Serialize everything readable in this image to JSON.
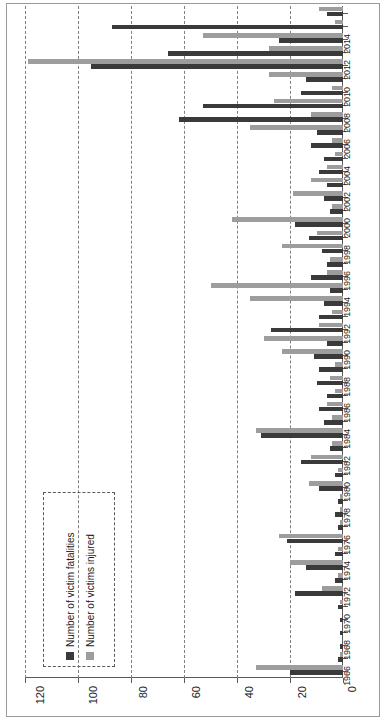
{
  "chart_data": {
    "type": "bar",
    "orientation": "horizontal",
    "title": "",
    "xlabel": "",
    "ylabel": "",
    "xlim": [
      0,
      120
    ],
    "x_axis_reversed": true,
    "xticks": [
      120,
      100,
      80,
      60,
      40,
      20,
      0
    ],
    "grid": true,
    "legend_position": "inside-left",
    "categories": [
      "2016",
      "2015",
      "2014",
      "2013",
      "2012",
      "2011",
      "2010",
      "2009",
      "2008",
      "2007",
      "2006",
      "2005",
      "2004",
      "2003",
      "2002",
      "2001",
      "2000",
      "1999",
      "1998",
      "1997",
      "1996",
      "1995",
      "1994",
      "1993",
      "1992",
      "1991",
      "1990",
      "1989",
      "1988",
      "1987",
      "1986",
      "1985",
      "1984",
      "1983",
      "1982",
      "1981",
      "1980",
      "1979",
      "1978",
      "1977",
      "1976",
      "1975",
      "1974",
      "1973",
      "1972",
      "1971",
      "1970",
      "1969",
      "1968",
      "1967",
      "1966"
    ],
    "series": [
      {
        "name": "Number of victim fatalities",
        "color": "#3a3a3a",
        "values": [
          6,
          87,
          24,
          66,
          95,
          14,
          16,
          53,
          62,
          10,
          12,
          7,
          9,
          6,
          7,
          5,
          18,
          13,
          8,
          6,
          12,
          5,
          7,
          9,
          27,
          6,
          11,
          9,
          10,
          6,
          9,
          7,
          31,
          5,
          16,
          3,
          9,
          2,
          3,
          2,
          21,
          3,
          14,
          3,
          18,
          2,
          1,
          1,
          1,
          2,
          20
        ]
      },
      {
        "name": "Number of victims injured",
        "color": "#9d9d9d",
        "values": [
          9,
          3,
          53,
          28,
          119,
          28,
          4,
          26,
          12,
          35,
          4,
          3,
          6,
          12,
          19,
          4,
          42,
          10,
          23,
          5,
          6,
          50,
          35,
          4,
          9,
          30,
          23,
          3,
          5,
          3,
          6,
          4,
          33,
          4,
          12,
          2,
          13,
          1,
          1,
          1,
          24,
          2,
          20,
          2,
          8,
          1,
          0,
          0,
          0,
          1,
          33
        ]
      }
    ],
    "year_tick_labels": [
      "2014",
      "2012",
      "2010",
      "2008",
      "2006",
      "2004",
      "2002",
      "2000",
      "1998",
      "1996",
      "1994",
      "1992",
      "1990",
      "1988",
      "1986",
      "1984",
      "1982",
      "1980",
      "1978",
      "1976",
      "1974",
      "1972",
      "1970",
      "1968",
      "1966"
    ]
  },
  "legend": {
    "items": [
      {
        "label": "Number of victim fatalities",
        "key": "fatal"
      },
      {
        "label": "Number of victims injured",
        "key": "injured"
      }
    ]
  },
  "axis": {
    "x_tick_labels": [
      "120",
      "100",
      "80",
      "60",
      "40",
      "20",
      "0"
    ]
  }
}
